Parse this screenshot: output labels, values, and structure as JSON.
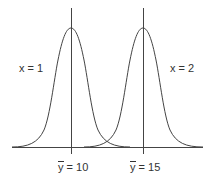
{
  "diagram": {
    "type": "two-normal-distributions",
    "colors": {
      "line": "#444444",
      "text": "#333333",
      "background": "#ffffff"
    },
    "curves": [
      {
        "label": "x = 1",
        "mean_symbol": "y",
        "mean_equals": " = 10",
        "mean_value": 10
      },
      {
        "label": "x = 2",
        "mean_symbol": "y",
        "mean_equals": " = 15",
        "mean_value": 15
      }
    ]
  }
}
